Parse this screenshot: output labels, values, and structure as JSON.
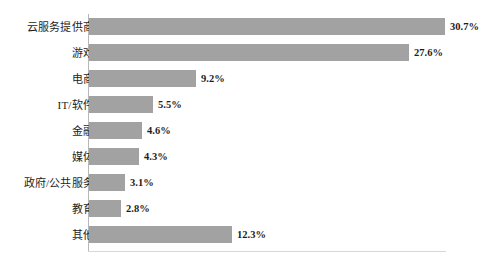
{
  "chart_data": {
    "type": "bar",
    "orientation": "horizontal",
    "title": "",
    "subtitle": "",
    "xlabel": "",
    "ylabel": "",
    "xlim": [
      0,
      30.7
    ],
    "grid": false,
    "legend": null,
    "value_suffix": "%",
    "categories": [
      "云服务提供商",
      "游戏",
      "电商",
      "IT/软件",
      "金融",
      "媒体",
      "政府/公共服务",
      "教育",
      "其他"
    ],
    "values": [
      30.7,
      27.6,
      9.2,
      5.5,
      4.6,
      4.3,
      3.1,
      2.8,
      12.3
    ],
    "value_labels": [
      "30.7%",
      "27.6%",
      "9.2%",
      "5.5%",
      "4.6%",
      "4.3%",
      "3.1%",
      "2.8%",
      "12.3%"
    ],
    "bar_color": "#a2a2a2",
    "axis_color": "#b7b7b7",
    "text_color": "#1d1d1d",
    "background_color": "#ffffff"
  }
}
